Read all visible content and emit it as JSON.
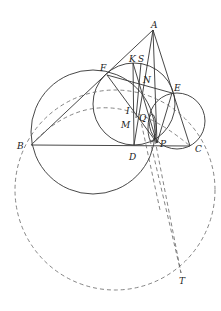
{
  "diagram": {
    "type": "geometry",
    "points": {
      "A": {
        "label": "A",
        "x": 153,
        "y": 30,
        "lx": 151,
        "ly": 28
      },
      "B": {
        "label": "B",
        "x": 31,
        "y": 145,
        "lx": 17,
        "ly": 148
      },
      "C": {
        "label": "C",
        "x": 190,
        "y": 146,
        "lx": 195,
        "ly": 151
      },
      "D": {
        "label": "D",
        "x": 134,
        "y": 145,
        "lx": 129,
        "ly": 159
      },
      "E": {
        "label": "E",
        "x": 172,
        "y": 93,
        "lx": 174,
        "ly": 90
      },
      "F": {
        "label": "F",
        "x": 107,
        "y": 75,
        "lx": 100,
        "ly": 70
      },
      "K": {
        "label": "K",
        "x": 133,
        "y": 63,
        "lx": 129,
        "ly": 62
      },
      "S": {
        "label": "S",
        "x": 141,
        "y": 63,
        "lx": 138,
        "ly": 62
      },
      "N": {
        "label": "N",
        "x": 143,
        "y": 80,
        "lx": 143,
        "ly": 82
      },
      "I": {
        "label": "I",
        "x": 134,
        "y": 104,
        "lx": 126,
        "ly": 113
      },
      "M": {
        "label": "M",
        "x": 133,
        "y": 122,
        "lx": 121,
        "ly": 127
      },
      "Q": {
        "label": "Q",
        "x": 148,
        "y": 117,
        "lx": 139,
        "ly": 120
      },
      "P": {
        "label": "P",
        "x": 157,
        "y": 143,
        "lx": 160,
        "ly": 146
      },
      "T": {
        "label": "T",
        "x": 181,
        "y": 273,
        "lx": 179,
        "ly": 283
      }
    },
    "labels": [
      "A",
      "B",
      "C",
      "D",
      "E",
      "F",
      "K",
      "S",
      "N",
      "I",
      "M",
      "Q",
      "P",
      "T"
    ]
  }
}
